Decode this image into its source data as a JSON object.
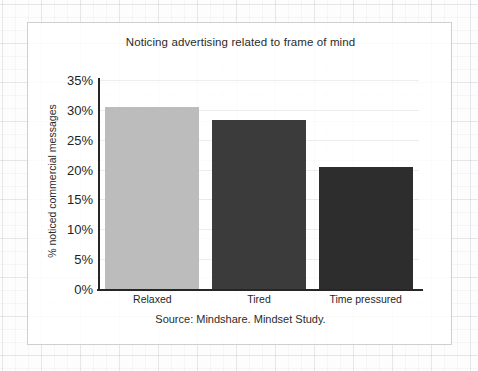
{
  "chart_data": {
    "type": "bar",
    "title": "Noticing advertising related to frame of mind",
    "xlabel": "",
    "ylabel": "% noticed commercial messages",
    "categories": [
      "Relaxed",
      "Tired",
      "Time pressured"
    ],
    "values": [
      30.5,
      28.3,
      20.5
    ],
    "ylim": [
      0,
      35
    ],
    "ytick_labels": [
      "0%",
      "5%",
      "10%",
      "15%",
      "20%",
      "25%",
      "30%",
      "35%"
    ],
    "ytick_values": [
      0,
      5,
      10,
      15,
      20,
      25,
      30,
      35
    ],
    "bar_colors": [
      "#bcbcbc",
      "#3b3b3b",
      "#2d2d2d"
    ],
    "grid": true,
    "legend": "none",
    "source_note": "Source: Mindshare. Mindset Study."
  },
  "axis": {
    "line_color": "#262626",
    "tick_label_color": "#1f1f1f"
  },
  "frame": {
    "border_color": "#cfcfd3",
    "background_color": "#ffffff"
  }
}
